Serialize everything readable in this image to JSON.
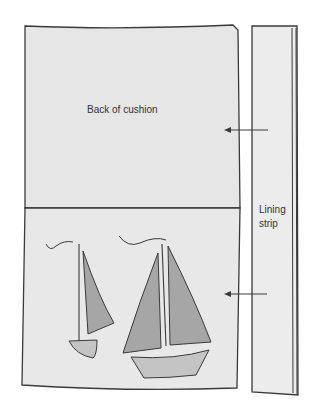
{
  "diagram": {
    "panels": [
      {
        "id": "back",
        "label": "Back of cushion"
      },
      {
        "id": "front",
        "label": ""
      },
      {
        "id": "lining",
        "label": "Lining strip"
      }
    ],
    "labels": {
      "back": "Back of cushion",
      "lining_line1": "Lining",
      "lining_line2": "strip"
    },
    "arrows": [
      {
        "from": "lining",
        "to": "back",
        "direction": "left"
      },
      {
        "from": "lining",
        "to": "front",
        "direction": "left"
      }
    ],
    "colors": {
      "panel_fill": "#e6e6e6",
      "outline": "#3a3a3a",
      "sail_fill": "#a6a6a6",
      "hull_fill": "#c4c4c4",
      "background": "#ffffff"
    }
  }
}
